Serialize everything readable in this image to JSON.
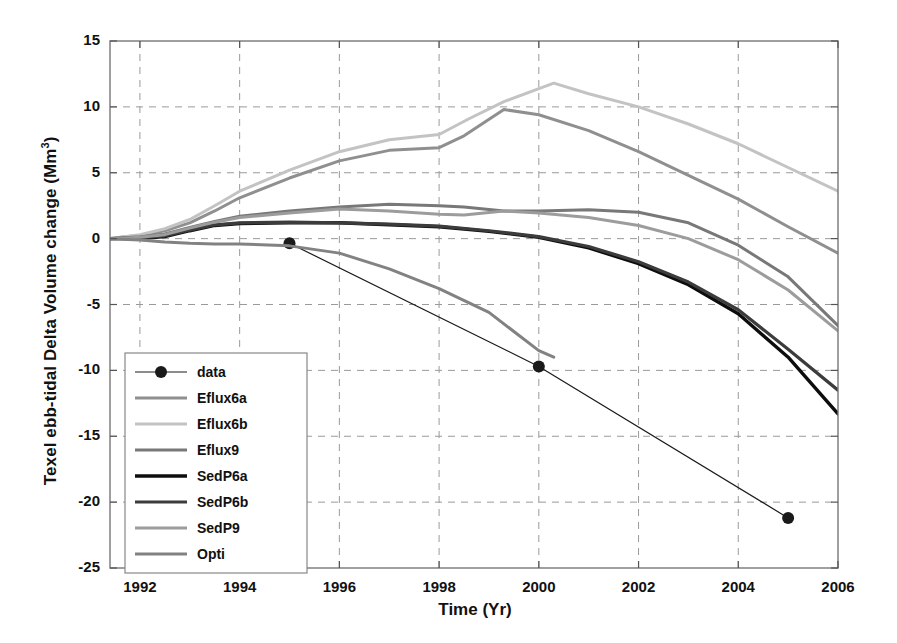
{
  "chart_data": {
    "type": "line",
    "title": "",
    "xlabel": "Time (Yr)",
    "ylabel_text": "Texel ebb-tidal Delta Volume change (Mm",
    "ylabel_sup": "3",
    "ylabel_tail": ")",
    "ylabel_full": "Texel ebb-tidal Delta Volume change (Mm 3)",
    "xlim": [
      1991.4,
      2006.0
    ],
    "ylim": [
      -25,
      15
    ],
    "xticks": [
      1992,
      1994,
      1996,
      1998,
      2000,
      2002,
      2004,
      2006
    ],
    "xtick_labels": [
      "1992",
      "1994",
      "1996",
      "1998",
      "2000",
      "2002",
      "2004",
      "2006"
    ],
    "yticks": [
      -25,
      -20,
      -15,
      -10,
      -5,
      0,
      5,
      10,
      15
    ],
    "ytick_labels": [
      "-25",
      "-20",
      "-15",
      "-10",
      "-5",
      "0",
      "5",
      "10",
      "15"
    ],
    "grid": true,
    "grid_style": "dashed",
    "grid_color": "#9a9a9a",
    "legend_position": "lower-left",
    "series": [
      {
        "name": "data",
        "color": "#1a1a1a",
        "width": 1.2,
        "marker": "filled-circle",
        "marker_size": 6,
        "x": [
          1995.0,
          2000.0,
          2005.0
        ],
        "y": [
          -0.35,
          -9.7,
          -21.2
        ]
      },
      {
        "name": "Eflux6a",
        "color": "#8f8f8f",
        "width": 3,
        "marker": "none",
        "x": [
          1991.4,
          1992.0,
          1992.5,
          1993.0,
          1993.5,
          1994.0,
          1995.0,
          1996.0,
          1997.0,
          1998.0,
          1998.5,
          1999.3,
          2000.0,
          2001.0,
          2002.0,
          2003.0,
          2004.0,
          2005.0,
          2006.0
        ],
        "y": [
          0.0,
          0.25,
          0.6,
          1.2,
          2.1,
          3.1,
          4.6,
          5.9,
          6.7,
          6.9,
          7.8,
          9.8,
          9.4,
          8.2,
          6.6,
          4.8,
          3.0,
          0.9,
          -1.1
        ]
      },
      {
        "name": "Eflux6b",
        "color": "#c3c3c3",
        "width": 3,
        "marker": "none",
        "x": [
          1991.4,
          1992.0,
          1992.5,
          1993.0,
          1993.5,
          1994.0,
          1995.0,
          1996.0,
          1997.0,
          1998.0,
          1998.6,
          1999.3,
          2000.3,
          2001.0,
          2002.0,
          2003.0,
          2004.0,
          2005.0,
          2006.0
        ],
        "y": [
          0.0,
          0.3,
          0.75,
          1.45,
          2.5,
          3.6,
          5.2,
          6.6,
          7.5,
          7.9,
          9.1,
          10.4,
          11.8,
          11.0,
          10.0,
          8.7,
          7.2,
          5.4,
          3.6
        ]
      },
      {
        "name": "Eflux9",
        "color": "#787878",
        "width": 3,
        "marker": "none",
        "x": [
          1991.4,
          1992.0,
          1992.5,
          1993.0,
          1993.5,
          1994.0,
          1995.0,
          1996.0,
          1997.0,
          1998.0,
          1998.5,
          1999.3,
          2000.0,
          2001.0,
          2002.0,
          2003.0,
          2004.0,
          2005.0,
          2006.0
        ],
        "y": [
          0.0,
          0.15,
          0.35,
          0.85,
          1.3,
          1.7,
          2.1,
          2.4,
          2.6,
          2.5,
          2.4,
          2.1,
          2.1,
          2.2,
          2.0,
          1.2,
          -0.5,
          -2.9,
          -6.6
        ]
      },
      {
        "name": "SedP6a",
        "color": "#0d0d0d",
        "width": 3.4,
        "marker": "none",
        "x": [
          1991.4,
          1992.0,
          1992.5,
          1993.0,
          1993.5,
          1994.0,
          1995.0,
          1996.0,
          1997.0,
          1998.0,
          1999.0,
          2000.0,
          2001.0,
          2002.0,
          2003.0,
          2004.0,
          2005.0,
          2006.0
        ],
        "y": [
          0.0,
          0.0,
          0.15,
          0.6,
          1.0,
          1.15,
          1.2,
          1.2,
          1.05,
          0.9,
          0.55,
          0.1,
          -0.7,
          -1.9,
          -3.5,
          -5.7,
          -9.0,
          -13.3
        ]
      },
      {
        "name": "SedP6b",
        "color": "#3c3c3c",
        "width": 3.2,
        "marker": "none",
        "x": [
          1991.4,
          1992.0,
          1992.5,
          1993.0,
          1993.5,
          1994.0,
          1995.0,
          1996.0,
          1997.0,
          1998.0,
          1999.0,
          2000.0,
          2001.0,
          2002.0,
          2003.0,
          2004.0,
          2005.0,
          2006.0
        ],
        "y": [
          0.0,
          0.05,
          0.2,
          0.65,
          1.05,
          1.2,
          1.25,
          1.2,
          1.1,
          0.95,
          0.6,
          0.15,
          -0.6,
          -1.75,
          -3.3,
          -5.4,
          -8.4,
          -11.5
        ]
      },
      {
        "name": "SedP9",
        "color": "#9c9c9c",
        "width": 3,
        "marker": "none",
        "x": [
          1991.4,
          1992.0,
          1992.5,
          1993.0,
          1993.5,
          1994.0,
          1995.0,
          1996.0,
          1997.0,
          1998.0,
          1998.5,
          1999.3,
          2000.0,
          2001.0,
          2002.0,
          2003.0,
          2004.0,
          2005.0,
          2006.0
        ],
        "y": [
          0.0,
          0.1,
          0.3,
          0.8,
          1.25,
          1.6,
          1.95,
          2.25,
          2.1,
          1.85,
          1.8,
          2.1,
          1.95,
          1.6,
          1.0,
          0.0,
          -1.6,
          -3.9,
          -7.0
        ]
      },
      {
        "name": "Opti",
        "color": "#828282",
        "width": 3,
        "marker": "none",
        "x": [
          1991.4,
          1992.0,
          1992.5,
          1993.0,
          1993.5,
          1994.0,
          1995.0,
          1996.0,
          1997.0,
          1998.0,
          1999.0,
          2000.0,
          2000.3
        ],
        "y": [
          0.0,
          -0.1,
          -0.25,
          -0.35,
          -0.4,
          -0.4,
          -0.55,
          -1.1,
          -2.3,
          -3.8,
          -5.6,
          -8.5,
          -9.0
        ]
      }
    ],
    "legend_entries": [
      {
        "label": "data",
        "color": "#1a1a1a",
        "width": 1.2,
        "marker": "filled-circle"
      },
      {
        "label": "Eflux6a",
        "color": "#8f8f8f",
        "width": 3,
        "marker": "none"
      },
      {
        "label": "Eflux6b",
        "color": "#c3c3c3",
        "width": 3,
        "marker": "none"
      },
      {
        "label": "Eflux9",
        "color": "#787878",
        "width": 3,
        "marker": "none"
      },
      {
        "label": "SedP6a",
        "color": "#0d0d0d",
        "width": 3.4,
        "marker": "none"
      },
      {
        "label": "SedP6b",
        "color": "#3c3c3c",
        "width": 3.2,
        "marker": "none"
      },
      {
        "label": "SedP9",
        "color": "#9c9c9c",
        "width": 3,
        "marker": "none"
      },
      {
        "label": "Opti",
        "color": "#828282",
        "width": 3,
        "marker": "none"
      }
    ]
  }
}
